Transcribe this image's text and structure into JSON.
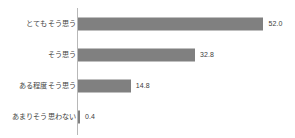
{
  "chart_data": {
    "type": "bar",
    "orientation": "horizontal",
    "title": "",
    "xlabel": "",
    "ylabel": "",
    "grid": false,
    "legend": false,
    "xlim": [
      0,
      60
    ],
    "categories": [
      "とてもそう思う",
      "そう思う",
      "ある程度そう思う",
      "あまりそう思わない"
    ],
    "values": [
      52.0,
      32.8,
      14.8,
      0.4
    ],
    "value_labels": [
      "52.0",
      "32.8",
      "14.8",
      "0.4"
    ],
    "series": [
      {
        "name": "",
        "values": [
          52.0,
          32.8,
          14.8,
          0.4
        ]
      }
    ],
    "colors": {
      "bar": "#808080",
      "axis": "#b8b8b8",
      "label_text": "#3f3f3f",
      "value_text": "#404040",
      "background": "#ffffff"
    }
  },
  "rows": [
    {
      "label": "とてもそう思う",
      "value": "52.0"
    },
    {
      "label": "そう思う",
      "value": "32.8"
    },
    {
      "label": "ある程度そう思う",
      "value": "14.8"
    },
    {
      "label": "あまりそう思わない",
      "value": "0.4"
    }
  ]
}
